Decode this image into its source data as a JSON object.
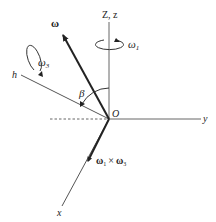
{
  "diagram": {
    "title": "",
    "origin_label": "O",
    "axes": {
      "vertical": "Z, z",
      "y": "y",
      "x": "x",
      "h": "h"
    },
    "vectors": {
      "omega": "ω",
      "omega1_x_omega3": {
        "a": "ω",
        "a_sub": "1",
        "op": "×",
        "b": "ω",
        "b_sub": "3"
      }
    },
    "rotations": {
      "omega1": {
        "base": "ω",
        "sub": "1"
      },
      "omega3": {
        "base": "ω",
        "sub": "3"
      }
    },
    "angle_label": "β",
    "colors": {
      "axis": "#555555",
      "vector": "#222222",
      "text": "#222222"
    }
  }
}
